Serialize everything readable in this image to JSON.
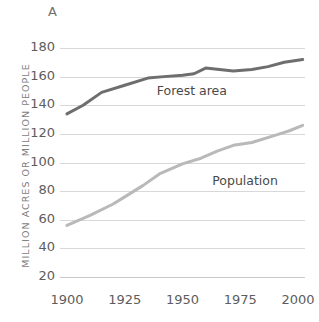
{
  "panel": {
    "letter": "A"
  },
  "chart_data": {
    "type": "line",
    "title": "",
    "subtitle": "",
    "xlabel": "",
    "ylabel": "MILLION ACRES OR MILLION PEOPLE",
    "xlim": [
      1897,
      2003
    ],
    "ylim": [
      20,
      180
    ],
    "ytick_labels": [
      "180",
      "160",
      "140",
      "120",
      "100",
      "80",
      "60",
      "40",
      "20"
    ],
    "ytick_values": [
      180,
      160,
      140,
      120,
      100,
      80,
      60,
      40,
      20
    ],
    "xtick_labels": [
      "1900",
      "1925",
      "1950",
      "1975",
      "2000"
    ],
    "xtick_values": [
      1900,
      1925,
      1950,
      1975,
      2000
    ],
    "grid": "horizontal",
    "legend": "inline-labels",
    "series": [
      {
        "name": "Forest area",
        "color": "#6e6e6e",
        "label_x": 1938,
        "label_y": 150,
        "x": [
          1900,
          1907,
          1915,
          1925,
          1935,
          1942,
          1950,
          1955,
          1960,
          1966,
          1972,
          1980,
          1987,
          1994,
          2002
        ],
        "values": [
          134,
          140,
          149,
          154,
          159,
          160,
          161,
          162,
          166,
          165,
          164,
          165,
          167,
          170,
          172
        ]
      },
      {
        "name": "Population",
        "color": "#b9b9b9",
        "label_x": 1962,
        "label_y": 87,
        "x": [
          1900,
          1910,
          1920,
          1925,
          1933,
          1940,
          1950,
          1958,
          1965,
          1972,
          1980,
          1990,
          1996,
          2002
        ],
        "values": [
          56,
          63,
          71,
          76,
          84,
          92,
          99,
          103,
          108,
          112,
          114,
          119,
          122,
          126
        ]
      }
    ]
  }
}
